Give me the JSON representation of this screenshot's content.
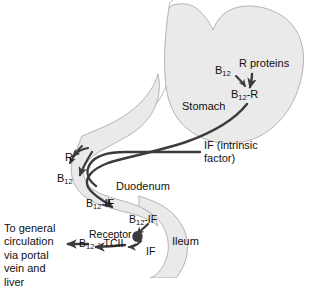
{
  "diagram": {
    "colors": {
      "organ_fill": "#eaeaea",
      "organ_stroke": "#b4b4b4",
      "arrow": "#3b3b3b",
      "text": "#101010",
      "background": "#ffffff"
    }
  },
  "organs": [
    {
      "name": "stomach",
      "label": "Stomach"
    },
    {
      "name": "duodenum",
      "label": "Duodenum"
    },
    {
      "name": "ileum",
      "label": "Ileum"
    }
  ],
  "labels": {
    "b12_stomach": {
      "base": "B",
      "sub": "12"
    },
    "r_proteins": "R proteins",
    "b12_r": {
      "base": "B",
      "sub": "12",
      "tail": "-R"
    },
    "stomach": "Stomach",
    "if_intrinsic": "IF (intrinsic factor)",
    "r_released": "R",
    "b12_duodenum": {
      "base": "B",
      "sub": "12"
    },
    "duodenum": "Duodenum",
    "b12_if_duodenum": {
      "base": "B",
      "sub": "12",
      "tail": "-IF"
    },
    "b12_if_ileum": {
      "base": "B",
      "sub": "12",
      "tail": "-IF"
    },
    "receptor": "Receptor",
    "b12_tcii": {
      "base": "B",
      "sub": "12",
      "tail": " · TCII"
    },
    "if_ileum": "IF",
    "ileum": "Ileum",
    "portal": "To general circulation via portal vein and liver"
  },
  "arrows": [
    {
      "name": "b12-to-b12r",
      "from": "B12",
      "to": "B12-R"
    },
    {
      "name": "rproteins-to-b12r",
      "from": "R proteins",
      "to": "B12-R"
    },
    {
      "name": "b12r-transit",
      "from": "B12-R (stomach)",
      "to": "duodenum"
    },
    {
      "name": "if-transit",
      "from": "IF (intrinsic factor)",
      "to": "duodenum"
    },
    {
      "name": "r-release",
      "from": "complex",
      "to": "R"
    },
    {
      "name": "b12-release",
      "from": "complex",
      "to": "B12"
    },
    {
      "name": "b12-if-form",
      "from": "B12 + IF",
      "to": "B12-IF"
    },
    {
      "name": "receptor-binding",
      "from": "B12-IF",
      "to": "Receptor"
    },
    {
      "name": "to-circulation",
      "from": "B12 · TCII",
      "to": "portal vein and liver"
    }
  ]
}
